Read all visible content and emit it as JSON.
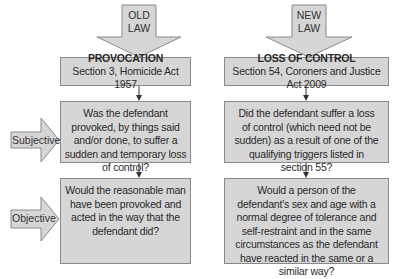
{
  "old_law": {
    "arrow_label_line1": "OLD",
    "arrow_label_line2": "LAW",
    "title": "PROVOCATION",
    "subtitle": "Section 3, Homicide Act 1957",
    "subjective_question": "Was the defendant provoked, by things said and/or done, to suffer a sudden and temporary loss of control?",
    "objective_question": "Would the reasonable man have been provoked and acted in the way that the defendant did?"
  },
  "new_law": {
    "arrow_label_line1": "NEW",
    "arrow_label_line2": "LAW",
    "title": "LOSS OF CONTROL",
    "subtitle": "Section 54, Coroners and Justice Act 2009",
    "subjective_question": "Did the defendant suffer a loss of control (which need not be sudden) as a result of one of the qualifying triggers listed in section 55?",
    "objective_question": "Would a person of the defendant's sex and age with a normal degree of tolerance and self-restraint and in the same circumstances as the defendant have reacted in the same or a similar way?"
  },
  "row_labels": {
    "subjective": "Subjective",
    "objective": "Objective"
  },
  "colors": {
    "box_fill": "#d6d6d6",
    "box_border": "#8a8a8a",
    "text": "#2a2a2a",
    "connector": "#333333"
  }
}
